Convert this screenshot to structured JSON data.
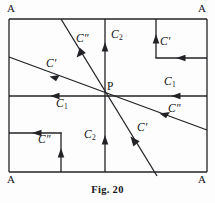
{
  "figure": {
    "caption": "Fig. 20",
    "point_label": "P",
    "corner_labels": {
      "top_left": "A",
      "top_right": "A",
      "bottom_left": "A",
      "bottom_right": "A"
    },
    "frame": {
      "left": 9,
      "top": 19,
      "right": 207,
      "bottom": 172
    },
    "center_point": {
      "x": 105,
      "y": 96
    },
    "stroke_color": "#232327",
    "background_color": "#fdfdfd",
    "labels": [
      {
        "id": "c2-upper",
        "text": "C",
        "sub": "2",
        "prime": "",
        "x": 112,
        "y": 36
      },
      {
        "id": "c2-lower",
        "text": "C",
        "sub": "2",
        "prime": "",
        "x": 86,
        "y": 136
      },
      {
        "id": "c1-right",
        "text": "C",
        "sub": "1",
        "prime": "",
        "x": 166,
        "y": 83
      },
      {
        "id": "c1-left",
        "text": "C",
        "sub": "1",
        "prime": "",
        "x": 55,
        "y": 104
      },
      {
        "id": "cpp-upper-left",
        "text": "C",
        "sub": "",
        "prime": "″",
        "x": 76,
        "y": 39
      },
      {
        "id": "cp-left",
        "text": "C",
        "sub": "",
        "prime": "′",
        "x": 45,
        "y": 64
      },
      {
        "id": "cp-inset-top-right",
        "text": "C",
        "sub": "",
        "prime": "′",
        "x": 159,
        "y": 41
      },
      {
        "id": "cpp-inset-bottom-left",
        "text": "C",
        "sub": "",
        "prime": "″",
        "x": 37,
        "y": 140
      },
      {
        "id": "cpp-lower-right",
        "text": "C",
        "sub": "",
        "prime": "″",
        "x": 168,
        "y": 108
      },
      {
        "id": "cp-lower",
        "text": "C",
        "sub": "",
        "prime": "′",
        "x": 136,
        "y": 128
      }
    ],
    "lines": [
      {
        "id": "frame-top",
        "x1": 9,
        "y1": 19,
        "x2": 207,
        "y2": 19
      },
      {
        "id": "frame-right",
        "x1": 207,
        "y1": 19,
        "x2": 207,
        "y2": 172
      },
      {
        "id": "frame-bottom",
        "x1": 9,
        "y1": 172,
        "x2": 207,
        "y2": 172
      },
      {
        "id": "frame-left",
        "x1": 9,
        "y1": 19,
        "x2": 9,
        "y2": 172
      },
      {
        "id": "axis-horizontal",
        "x1": 9,
        "y1": 96,
        "x2": 207,
        "y2": 96
      },
      {
        "id": "axis-vertical",
        "x1": 105,
        "y1": 19,
        "x2": 105,
        "y2": 172
      },
      {
        "id": "diagonal-steep",
        "x1": 61,
        "y1": 19,
        "x2": 157,
        "y2": 176
      },
      {
        "id": "diagonal-shallow",
        "x1": 9,
        "y1": 57,
        "x2": 207,
        "y2": 130
      },
      {
        "id": "inset-tr-vertical",
        "x1": 156,
        "y1": 19,
        "x2": 156,
        "y2": 58
      },
      {
        "id": "inset-tr-horizontal",
        "x1": 156,
        "y1": 58,
        "x2": 207,
        "y2": 58
      },
      {
        "id": "inset-bl-horizontal",
        "x1": 9,
        "y1": 133,
        "x2": 61,
        "y2": 133
      },
      {
        "id": "inset-bl-vertical",
        "x1": 61,
        "y1": 133,
        "x2": 61,
        "y2": 172
      }
    ],
    "arrows": [
      {
        "id": "arrow-c2-upper",
        "x": 105,
        "y": 47,
        "direction": "up"
      },
      {
        "id": "arrow-c2-lower",
        "x": 105,
        "y": 141,
        "direction": "up"
      },
      {
        "id": "arrow-c1-right",
        "x": 177,
        "y": 96,
        "direction": "left"
      },
      {
        "id": "arrow-c1-left",
        "x": 56,
        "y": 96,
        "direction": "left"
      },
      {
        "id": "arrow-cpp-upper",
        "x": 81,
        "y": 52,
        "direction": "down-right"
      },
      {
        "id": "arrow-cp-left",
        "x": 56,
        "y": 74,
        "direction": "down-left"
      },
      {
        "id": "arrow-cpp-lower-right",
        "x": 165,
        "y": 116,
        "direction": "down-right-rev"
      },
      {
        "id": "arrow-cp-lower",
        "x": 134,
        "y": 143,
        "direction": "up-left"
      },
      {
        "id": "arrow-inset-tr-vertical",
        "x": 156,
        "y": 40,
        "direction": "up"
      },
      {
        "id": "arrow-inset-tr-horizontal",
        "x": 181,
        "y": 58,
        "direction": "left"
      },
      {
        "id": "arrow-inset-bl-horizontal",
        "x": 37,
        "y": 133,
        "direction": "left"
      },
      {
        "id": "arrow-inset-bl-vertical",
        "x": 61,
        "y": 154,
        "direction": "up"
      }
    ]
  }
}
